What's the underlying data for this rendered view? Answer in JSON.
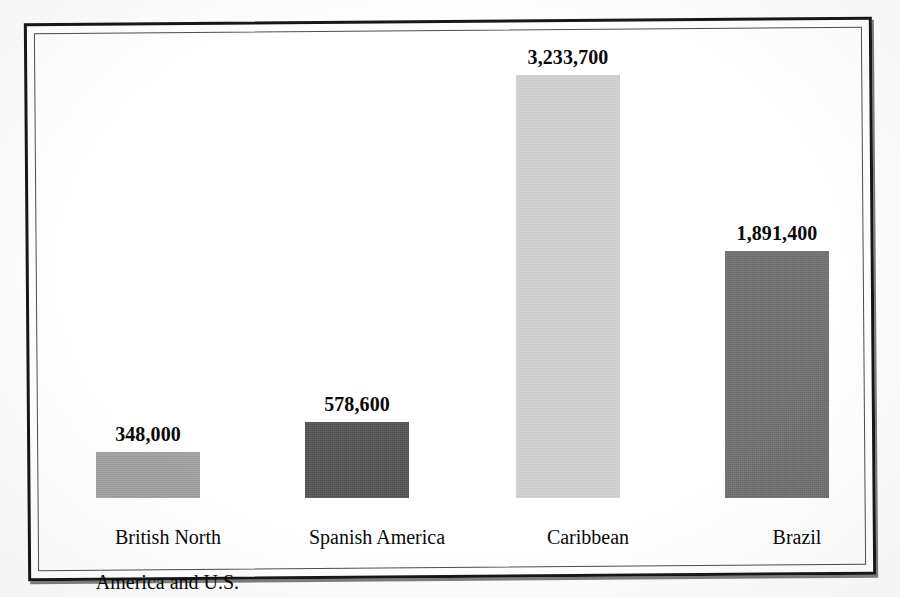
{
  "figure": {
    "background_color": "#fdfdfd",
    "panel_color": "#ffffff",
    "frame_color": "#15171a",
    "text_color": "#0a0a0a"
  },
  "chart_data": {
    "type": "bar",
    "title": "",
    "subtitle": "",
    "xlabel": "",
    "ylabel": "",
    "categories": [
      "British North\nAmerica and U.S.",
      "Spanish America",
      "Caribbean",
      "Brazil"
    ],
    "values": [
      348000,
      578600,
      3233700,
      1891400
    ],
    "value_labels": [
      "348,000",
      "578,600",
      "3,233,700",
      "1,891,400"
    ],
    "bar_colors": [
      "#a2a2a2",
      "#545454",
      "#d3d3d3",
      "#6f6f6f"
    ],
    "ylim": [
      0,
      3233700
    ],
    "grid": false,
    "axis_visible": false,
    "legend": "none",
    "orientation": "vertical",
    "value_labels_position": "above-bar"
  },
  "bars": [
    {
      "label": "British North\nAmerica and U.S.",
      "label_line1": "British North",
      "label_line2": "America and U.S.",
      "value": 348000,
      "value_label": "348,000",
      "color": "#a2a2a2"
    },
    {
      "label": "Spanish America",
      "label_line1": "Spanish America",
      "label_line2": "",
      "value": 578600,
      "value_label": "578,600",
      "color": "#545454"
    },
    {
      "label": "Caribbean",
      "label_line1": "Caribbean",
      "label_line2": "",
      "value": 3233700,
      "value_label": "3,233,700",
      "color": "#d3d3d3"
    },
    {
      "label": "Brazil",
      "label_line1": "Brazil",
      "label_line2": "",
      "value": 1891400,
      "value_label": "1,891,400",
      "color": "#6f6f6f"
    }
  ],
  "layout": {
    "baseline_y": 498,
    "bar_width": 104,
    "bar_left_x": [
      96,
      305,
      516,
      725
    ],
    "px_per_unit": 0.0001308
  }
}
